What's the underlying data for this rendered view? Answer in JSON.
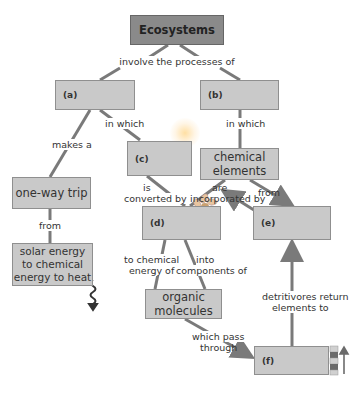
{
  "diagram": {
    "title": "Ecosystems",
    "root_link": "involve the processes of",
    "nodes": {
      "a": "(a)",
      "b": "(b)",
      "c": "(c)",
      "d": "(d)",
      "e": "(e)",
      "f": "(f)",
      "one_way_trip": "one-way trip",
      "solar": "solar energy to chemical energy to heat",
      "chemical_elements": "chemical elements",
      "organic_molecules": "organic molecules"
    },
    "links": {
      "a_makes": "makes a",
      "a_in_which": "in which",
      "b_in_which": "in which",
      "trip_from": "from",
      "c_converted_1": "is",
      "c_converted_2": "converted by",
      "ce_are": "are",
      "ce_incorporated": "incorporated by",
      "ce_from": "from",
      "d_to_chem_1": "to chemical",
      "d_to_chem_2": "energy of",
      "d_into_1": "into",
      "d_into_2": "components of",
      "detritivores_1": "detritivores return",
      "detritivores_2": "elements to",
      "pass_1": "which pass",
      "pass_2": "through"
    },
    "icons": [
      "sunlight-rays-icon",
      "sun-glow-icon",
      "flower-icon",
      "heat-squiggle-icon",
      "trophic-layers-icon",
      "up-arrow-icon"
    ],
    "colors": {
      "box_fill": "#c9c9c9",
      "title_fill": "#8a8a8a",
      "line": "#7a7a7a"
    }
  }
}
